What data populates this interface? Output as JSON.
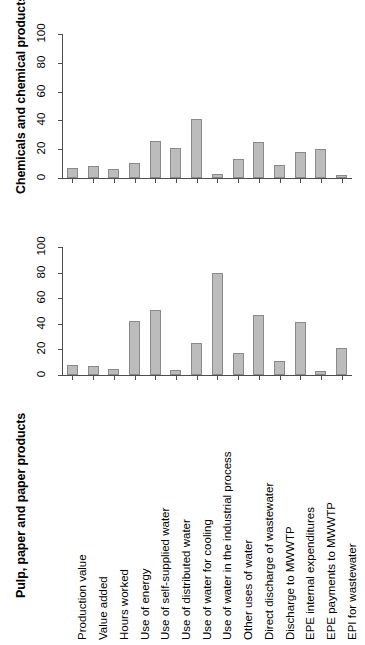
{
  "chart_data": [
    {
      "type": "bar",
      "title": "",
      "ylabel": "Chemicals and chemical products",
      "xlabel": "",
      "ylim": [
        0,
        100
      ],
      "yticks": [
        0,
        20,
        40,
        60,
        80,
        100
      ],
      "grid": false,
      "legend": "none",
      "bar_color": "#bcbcbc",
      "bar_border_color": "#8a8a8a",
      "categories": [
        "Production value",
        "Value added",
        "Hours worked",
        "Use of energy",
        "Use of self-supplied water",
        "Use of distributed water",
        "Use of water for cooling",
        "Use of water in the industrial process",
        "Other uses of water",
        "Direct discharge of wastewater",
        "Discharge to MWWTP",
        "EPE internal expenditures",
        "EPE payments to MWWTP",
        "EPI for wastewater"
      ],
      "values": [
        7,
        8.5,
        6,
        10.5,
        26,
        20.5,
        41,
        3,
        13,
        25,
        9,
        18,
        20,
        2
      ]
    },
    {
      "type": "bar",
      "title": "",
      "ylabel": "Pulp, paper and paper products",
      "xlabel": "",
      "ylim": [
        0,
        100
      ],
      "yticks": [
        0,
        20,
        40,
        60,
        80,
        100
      ],
      "grid": false,
      "legend": "none",
      "bar_color": "#bcbcbc",
      "bar_border_color": "#8a8a8a",
      "categories": [
        "Production value",
        "Value added",
        "Hours worked",
        "Use of energy",
        "Use of self-supplied water",
        "Use of distributed water",
        "Use of water for cooling",
        "Use of water in the industrial process",
        "Other uses of water",
        "Direct discharge of wastewater",
        "Discharge to MWWTP",
        "EPE internal expenditures",
        "EPE payments to MWWTP",
        "EPI for wastewater"
      ],
      "values": [
        8,
        7,
        5,
        42,
        50.5,
        4,
        25,
        79.5,
        17,
        46.5,
        11,
        41.5,
        3.5,
        21
      ]
    }
  ],
  "panels": {
    "chemicals": {
      "axis_title": "Chemicals and chemical products",
      "ytick_labels": [
        "0",
        "20",
        "40",
        "60",
        "80",
        "100"
      ]
    },
    "pulp": {
      "axis_title": "Pulp, paper and paper products",
      "ytick_labels": [
        "0",
        "20",
        "40",
        "60",
        "80",
        "100"
      ]
    }
  },
  "x_axis": {
    "labels": [
      "Production value",
      "Value added",
      "Hours worked",
      "Use of energy",
      "Use of self-supplied water",
      "Use of distributed water",
      "Use of water for cooling",
      "Use of water in the industrial process",
      "Other uses of water",
      "Direct discharge of wastewater",
      "Discharge to MWWTP",
      "EPE internal expenditures",
      "EPE payments to MWWTP",
      "EPI for wastewater"
    ]
  }
}
